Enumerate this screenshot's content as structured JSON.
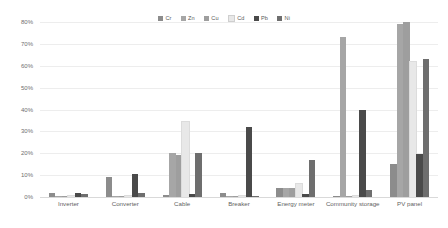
{
  "chart_data": {
    "type": "bar",
    "title": "",
    "subtitle": "",
    "xlabel": "",
    "ylabel": "",
    "ylim": [
      0,
      80
    ],
    "ytick_labels": [
      "0%",
      "10%",
      "20%",
      "30%",
      "40%",
      "50%",
      "60%",
      "70%",
      "80%"
    ],
    "ytick_values": [
      0,
      10,
      20,
      30,
      40,
      50,
      60,
      70,
      80
    ],
    "grid": true,
    "legend_position": "top-center",
    "categories": [
      "Inverter",
      "Converter",
      "Cable",
      "Breaker",
      "Energy meter",
      "Community storage",
      "PV panel"
    ],
    "series": [
      {
        "name": "Cr",
        "color": "#8c8c8c",
        "values": [
          2.0,
          9.0,
          1.0,
          2.0,
          4.0,
          0.3,
          15.0
        ]
      },
      {
        "name": "Zn",
        "color": "#a6a6a6",
        "values": [
          0.4,
          0.5,
          20.0,
          0.4,
          4.0,
          73.0,
          79.0
        ]
      },
      {
        "name": "Cu",
        "color": "#9e9e9e",
        "values": [
          0.3,
          0.6,
          19.0,
          0.3,
          4.0,
          0.5,
          80.0
        ]
      },
      {
        "name": "Cd",
        "color": "#e8e8e8",
        "values": [
          0.3,
          0.4,
          34.5,
          0.3,
          6.0,
          0.3,
          61.5
        ]
      },
      {
        "name": "Pb",
        "color": "#4a4a4a",
        "values": [
          2.0,
          10.5,
          1.5,
          32.0,
          1.5,
          40.0,
          19.5
        ]
      },
      {
        "name": "Ni",
        "color": "#6e6e6e",
        "values": [
          1.2,
          2.0,
          20.0,
          0.6,
          17.0,
          3.0,
          63.0
        ]
      }
    ]
  }
}
